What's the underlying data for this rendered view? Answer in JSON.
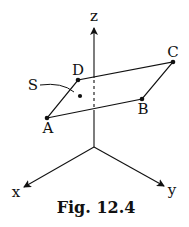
{
  "figure": {
    "caption": "Fig. 12.4",
    "axes": {
      "x_label": "x",
      "y_label": "y",
      "z_label": "z"
    },
    "points": {
      "A": "A",
      "B": "B",
      "C": "C",
      "D": "D"
    },
    "surface_label": "S",
    "colors": {
      "ink": "#111111",
      "background": "#ffffff"
    }
  }
}
